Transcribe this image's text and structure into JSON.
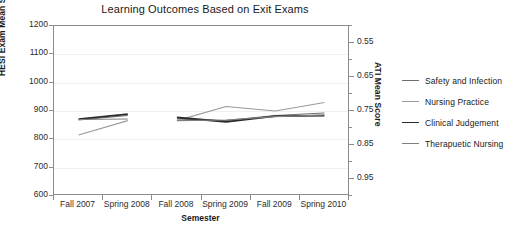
{
  "chart_data": {
    "type": "line",
    "title": "Learning Outcomes Based on Exit Exams",
    "xlabel": "Semester",
    "ylabel": "HESI Exam Mean Score",
    "ylabel_right": "ATI Mean Score",
    "categories": [
      "Fall 2007",
      "Spring 2008",
      "Fall 2008",
      "Spring 2009",
      "Fall 2009",
      "Spring 2010"
    ],
    "ylim": [
      600,
      1200
    ],
    "yticks": [
      600,
      700,
      800,
      900,
      1000,
      1100,
      1200
    ],
    "ylim_right": [
      0.5,
      1.0
    ],
    "yticks_right": [
      0.55,
      0.65,
      0.75,
      0.85,
      0.95
    ],
    "yticks_right_minor": [
      0.5,
      0.6,
      0.7,
      0.8,
      0.9,
      1.0
    ],
    "grid": true,
    "legend_position": "right",
    "note": "Series are drawn as two disconnected segments: Fall 2007-Spring 2008 and Fall 2008-Spring 2010.",
    "series": [
      {
        "name": "Safety and Infection",
        "color": "#6f6f6f",
        "width": 1.1,
        "values": [
          868,
          884,
          872,
          866,
          884,
          893
        ]
      },
      {
        "name": "Nursing Practice",
        "color": "#9a9a9a",
        "width": 1.1,
        "values": [
          815,
          866,
          866,
          916,
          900,
          930
        ]
      },
      {
        "name": "Clinical Judgement",
        "color": "#2b2b2b",
        "width": 1.8,
        "values": [
          871,
          889,
          877,
          862,
          882,
          884
        ]
      },
      {
        "name": "Therapuetic Nursing",
        "color": "#808080",
        "width": 1.1,
        "values": [
          870,
          872,
          866,
          868,
          880,
          886
        ]
      }
    ]
  },
  "axis": {
    "left_ticks": [
      "1200",
      "1100",
      "1000",
      "900",
      "800",
      "700",
      "600"
    ],
    "right_ticks": [
      "0.95",
      "0.85",
      "0.75",
      "0.65",
      "0.55"
    ]
  }
}
